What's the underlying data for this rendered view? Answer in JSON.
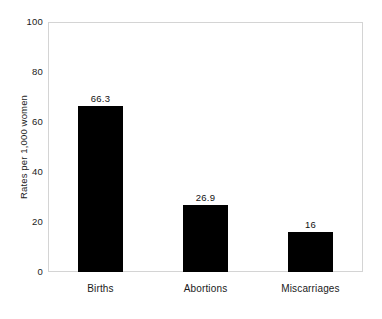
{
  "chart_data": {
    "type": "bar",
    "title": "",
    "subtitle": "",
    "xlabel": "",
    "ylabel": "Rates per 1,000 women",
    "categories": [
      "Births",
      "Abortions",
      "Miscarriages"
    ],
    "values": [
      66.3,
      26.9,
      16
    ],
    "value_labels": [
      "66.3",
      "26.9",
      "16"
    ],
    "ylim": [
      0,
      100
    ],
    "yticks": [
      "100",
      "80",
      "60",
      "40",
      "20",
      "0"
    ],
    "ytick_values": [
      100,
      80,
      60,
      40,
      20,
      0
    ],
    "grid": false,
    "legend": "none",
    "bar_color": "#000000",
    "frame_color": "#d4d4d4",
    "background_color": "#ffffff",
    "series": [
      {
        "name": "Rates per 1,000 women",
        "values": [
          66.3,
          26.9,
          16
        ]
      }
    ]
  }
}
